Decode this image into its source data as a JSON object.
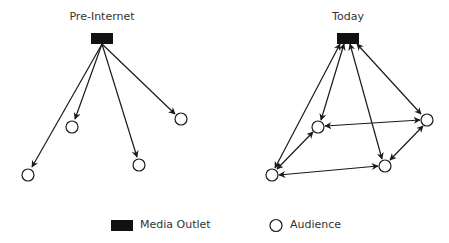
{
  "panels": [
    {
      "title": "Pre-Internet",
      "outlet": {
        "x": 91,
        "y": 33,
        "w": 22,
        "h": 11
      },
      "audience": [
        {
          "cx": 28,
          "cy": 175
        },
        {
          "cx": 72,
          "cy": 127
        },
        {
          "cx": 139,
          "cy": 165
        },
        {
          "cx": 181,
          "cy": 119
        }
      ],
      "edges": [
        {
          "from": [
            102,
            44
          ],
          "to": [
            32,
            167
          ],
          "dir": "one"
        },
        {
          "from": [
            102,
            44
          ],
          "to": [
            75,
            119
          ],
          "dir": "one"
        },
        {
          "from": [
            102,
            44
          ],
          "to": [
            137,
            157
          ],
          "dir": "one"
        },
        {
          "from": [
            102,
            44
          ],
          "to": [
            175,
            114
          ],
          "dir": "one"
        }
      ]
    },
    {
      "title": "Today",
      "outlet": {
        "x": 337,
        "y": 33,
        "w": 22,
        "h": 11
      },
      "audience": [
        {
          "cx": 318,
          "cy": 127
        },
        {
          "cx": 427,
          "cy": 120
        },
        {
          "cx": 385,
          "cy": 166
        },
        {
          "cx": 272,
          "cy": 175
        }
      ],
      "edges": [
        {
          "from": [
            340,
            44
          ],
          "to": [
            275,
            168
          ],
          "dir": "both"
        },
        {
          "from": [
            344,
            44
          ],
          "to": [
            321,
            120
          ],
          "dir": "both"
        },
        {
          "from": [
            350,
            44
          ],
          "to": [
            382,
            159
          ],
          "dir": "both"
        },
        {
          "from": [
            357,
            44
          ],
          "to": [
            421,
            114
          ],
          "dir": "both"
        },
        {
          "from": [
            325,
            126
          ],
          "to": [
            420,
            120
          ],
          "dir": "both"
        },
        {
          "from": [
            313,
            132
          ],
          "to": [
            277,
            169
          ],
          "dir": "both"
        },
        {
          "from": [
            279,
            175
          ],
          "to": [
            378,
            166
          ],
          "dir": "both"
        },
        {
          "from": [
            390,
            160
          ],
          "to": [
            423,
            126
          ],
          "dir": "both"
        }
      ]
    }
  ],
  "legend": {
    "outlet_label": "Media Outlet",
    "audience_label": "Audience"
  },
  "colors": {
    "outlet_fill": "#111111",
    "line": "#1a1a1a",
    "text": "#333333"
  }
}
